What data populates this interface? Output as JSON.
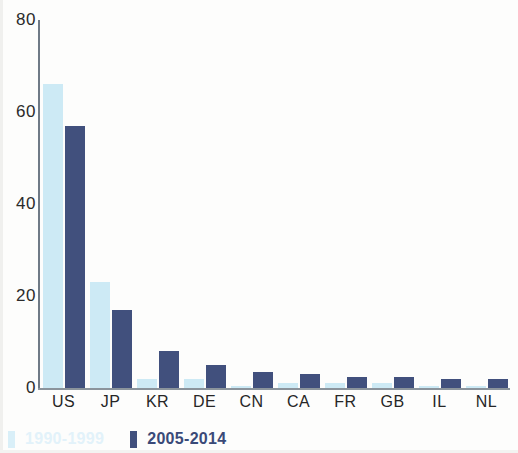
{
  "chart_data": {
    "type": "bar",
    "title": "",
    "subtitle": "",
    "xlabel": "",
    "ylabel": "",
    "ylim": [
      0,
      80
    ],
    "yticks": [
      0,
      20,
      40,
      60,
      80
    ],
    "grid": false,
    "legend_position": "bottom-left",
    "categories": [
      "US",
      "JP",
      "KR",
      "DE",
      "CN",
      "CA",
      "FR",
      "GB",
      "IL",
      "NL"
    ],
    "series": [
      {
        "name": "1990-1999",
        "color": "#cdeaf5",
        "values": [
          66,
          23,
          2,
          2,
          0.5,
          1,
          1,
          1,
          0.5,
          0.5
        ]
      },
      {
        "name": "2005-2014",
        "color": "#41507d",
        "values": [
          57,
          17,
          8,
          5,
          3.5,
          3,
          2.5,
          2.5,
          2,
          2
        ]
      }
    ]
  },
  "legend": {
    "items": [
      {
        "label": "1990-1999",
        "swatch": "light"
      },
      {
        "label": "2005-2014",
        "swatch": "dark"
      }
    ]
  },
  "axis": {
    "y_tick_labels": [
      "80",
      "60",
      "40",
      "20",
      "0"
    ]
  }
}
